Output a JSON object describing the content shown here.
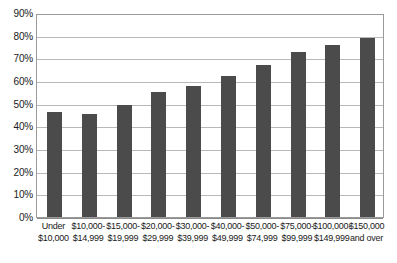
{
  "chart_data": {
    "type": "bar",
    "title": "",
    "subtitle": "",
    "xlabel": "",
    "ylabel": "",
    "grid": true,
    "legend": false,
    "ylim": [
      0,
      90
    ],
    "ytick_values": [
      0,
      10,
      20,
      30,
      40,
      50,
      60,
      70,
      80,
      90
    ],
    "ytick_labels": [
      "0%",
      "10%",
      "20%",
      "30%",
      "40%",
      "50%",
      "60%",
      "70%",
      "80%",
      "90%"
    ],
    "categories": [
      "Under $10,000",
      "$10,000-$14,999",
      "$15,000-$19,999",
      "$20,000-$29,999",
      "$30,000-$39,999",
      "$40,000-$49,999",
      "$50,000-$74,999",
      "$75,000-$99,999",
      "$100,000-$149,999",
      "$150,000 and over"
    ],
    "category_lines": [
      [
        "Under",
        "$10,000"
      ],
      [
        "$10,000-",
        "$14,999"
      ],
      [
        "$15,000-",
        "$19,999"
      ],
      [
        "$20,000-",
        "$29,999"
      ],
      [
        "$30,000-",
        "$39,999"
      ],
      [
        "$40,000-",
        "$49,999"
      ],
      [
        "$50,000-",
        "$74,999"
      ],
      [
        "$75,000-",
        "$99,999"
      ],
      [
        "$100,000-",
        "$149,999"
      ],
      [
        "$150,000",
        "and over"
      ]
    ],
    "values": [
      46.5,
      45.5,
      49.5,
      55,
      58,
      62,
      67,
      73,
      76,
      79
    ],
    "bar_color": "#4b4b4b",
    "gridline_color": "#b8b8b8",
    "axis_color": "#9a9a9a",
    "background_color": "#ffffff"
  }
}
